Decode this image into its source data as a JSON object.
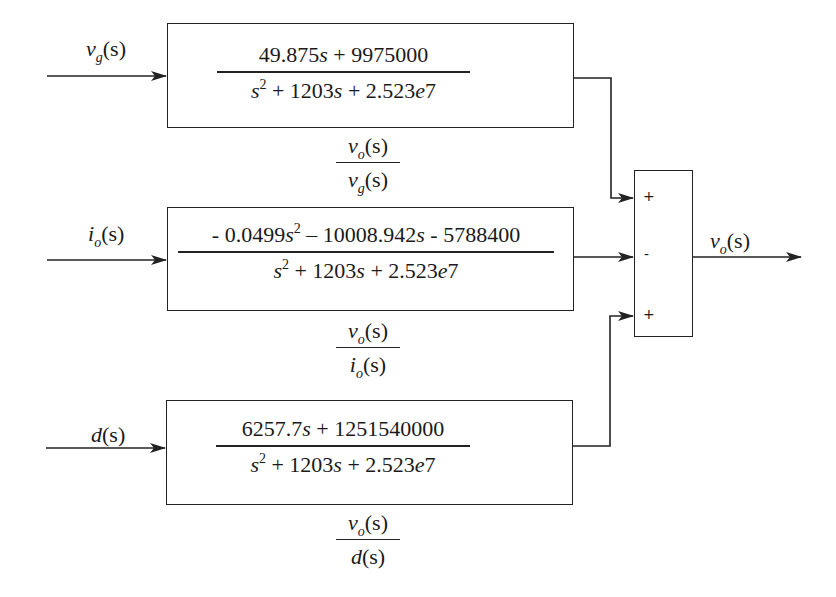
{
  "diagram": {
    "type": "block-diagram",
    "inputs": [
      {
        "id": "vg",
        "symbol": "v",
        "subscript": "g",
        "arg": "(s)"
      },
      {
        "id": "io",
        "symbol": "i",
        "subscript": "o",
        "arg": "(s)"
      },
      {
        "id": "d",
        "symbol": "d",
        "subscript": "",
        "arg": "(s)"
      }
    ],
    "blocks": [
      {
        "id": "block-vg",
        "numerator": "49.875s + 9975000",
        "numerator_parts": [
          "49.875",
          "s",
          " + 9975000"
        ],
        "denominator_parts": [
          "s",
          "2",
          " + 1203",
          "s",
          " + 2.523",
          "e",
          "7"
        ],
        "caption": {
          "num_symbol": "v",
          "num_sub": "o",
          "num_arg": "(s)",
          "den_symbol": "v",
          "den_sub": "g",
          "den_arg": "(s)"
        }
      },
      {
        "id": "block-io",
        "numerator": "- 0.0499s^2 - 10008.942s - 5788400",
        "numerator_parts": [
          "- 0.0499",
          "s",
          "2",
          " – 10008.942",
          "s",
          " - 5788400"
        ],
        "denominator_parts": [
          "s",
          "2",
          " + 1203",
          "s",
          " + 2.523",
          "e",
          "7"
        ],
        "caption": {
          "num_symbol": "v",
          "num_sub": "o",
          "num_arg": "(s)",
          "den_symbol": "i",
          "den_sub": "o",
          "den_arg": "(s)"
        }
      },
      {
        "id": "block-d",
        "numerator": "6257.7s + 1251540000",
        "numerator_parts": [
          "6257.7",
          "s",
          " + 1251540000"
        ],
        "denominator_parts": [
          "s",
          "2",
          " + 1203",
          "s",
          " + 2.523",
          "e",
          "7"
        ],
        "caption": {
          "num_symbol": "v",
          "num_sub": "o",
          "num_arg": "(s)",
          "den_symbol": "d",
          "den_sub": "",
          "den_arg": "(s)"
        }
      }
    ],
    "summing_junction": {
      "signs": [
        "+",
        "-",
        "+"
      ]
    },
    "output": {
      "symbol": "v",
      "subscript": "o",
      "arg": "(s)"
    }
  }
}
